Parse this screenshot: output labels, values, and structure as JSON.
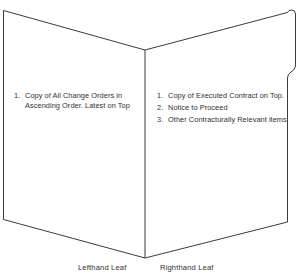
{
  "figure": {
    "title_clipped": "Figure  Construction Filing Binder",
    "background_color": "#ffffff",
    "line_color": "#3a3a3a",
    "text_color": "#2f2f2f"
  },
  "left_leaf": {
    "caption": "Lefthand Leaf",
    "items": [
      {
        "number": "1.",
        "text": "Copy of All Change Orders in Ascending Order. Latest on Top"
      }
    ]
  },
  "right_leaf": {
    "caption": "Righthand Leaf",
    "items": [
      {
        "number": "1.",
        "text": "Copy of Executed Contract on Top."
      },
      {
        "number": "2.",
        "text": "Notice to Proceed"
      },
      {
        "number": "3.",
        "text": "Other Contracturally Relevant items"
      }
    ]
  },
  "shapes": {
    "binder_outline_name": "open-binder-outline",
    "spine_name": "binder-spine-fold",
    "tab_name": "binder-index-tab"
  }
}
